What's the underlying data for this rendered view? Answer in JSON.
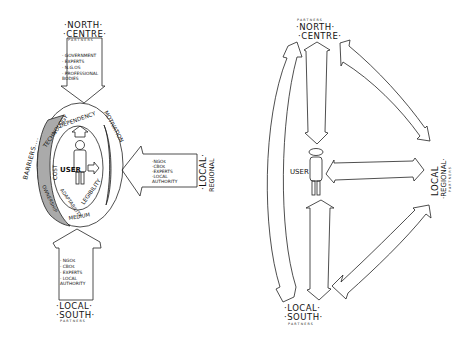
{
  "left_diagram": {
    "north": {
      "line1": "·NORTH·",
      "line2": "·CENTRE·",
      "sub": "PARTNERS",
      "items": [
        "· GOVERNMENT",
        "· EXPERTS",
        "· N.G.OS",
        "· PROFESSIONAL",
        "  BODIES"
      ]
    },
    "east": {
      "line1": "·LOCAL·",
      "line2": "REGIONAL",
      "items": [
        "·NGOs",
        "·CBOs",
        "·EXPERTS",
        "·LOCAL",
        " AUTHORITY"
      ]
    },
    "south": {
      "line1": "·LOCAL·",
      "line2": "·SOUTH·",
      "sub": "PARTNERS",
      "items": [
        "· NGOs",
        "· CBOs",
        "· EXPERTS",
        "· LOCAL",
        "  AUTHORITY"
      ]
    },
    "ring": {
      "barriers": "BARRIERS....",
      "technology": "TECHNOLOGY",
      "dependency": "DEPENDENCY",
      "motivation": "MOTIVATION",
      "cost": "COST",
      "ownership": "OWNERSHIP",
      "adaptability": "ADAPTABILITY",
      "legibility": "LEGIBILITY",
      "medium": "MEDIUM"
    },
    "user": "USER"
  },
  "right_diagram": {
    "north": {
      "sub": "PARTNERS",
      "line1": "·NORTH·",
      "line2": "·CENTRE·"
    },
    "east": {
      "line1": "LOCAL",
      "line2": "·REGIONAL·",
      "sub": "PARTNERS"
    },
    "south": {
      "line1": "·LOCAL·",
      "line2": "·SOUTH·",
      "sub": "PARTNERS"
    },
    "user": "USER"
  }
}
